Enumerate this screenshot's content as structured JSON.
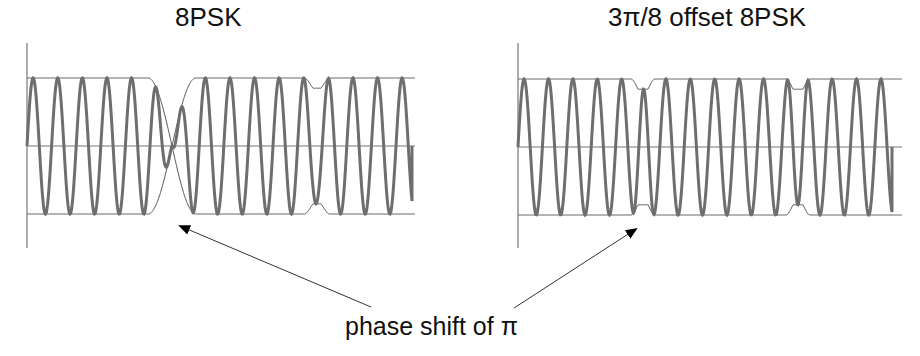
{
  "panels": [
    {
      "title": "8PSK",
      "scheme": "8PSK",
      "carrier_cycles_per_symbol": 5,
      "symbols": [
        {
          "phase_change": "start"
        },
        {
          "phase_change": "pi",
          "envelope": "zero-crossing"
        },
        {
          "phase_change": "pi/4",
          "envelope": "small-dip"
        },
        {
          "phase_change": "end"
        }
      ]
    },
    {
      "title": "3π/8 offset 8PSK",
      "scheme": "3pi/8 offset 8PSK",
      "carrier_cycles_per_symbol": 5,
      "symbols": [
        {
          "phase_change": "start"
        },
        {
          "phase_change": "pi-limited",
          "envelope": "small-dip"
        },
        {
          "phase_change": "pi-limited",
          "envelope": "small-dip"
        },
        {
          "phase_change": "end"
        }
      ]
    }
  ],
  "annotation": {
    "caption": "phase shift of π",
    "points_to": [
      "8PSK envelope zero-crossing",
      "3π/8 offset 8PSK first transition"
    ]
  },
  "colors": {
    "carrier": "#6e6e6e",
    "envelope": "#555555",
    "axis": "#777777",
    "arrow": "#333333",
    "text": "#111111"
  }
}
